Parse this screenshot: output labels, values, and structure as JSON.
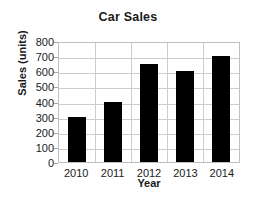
{
  "chart_data": {
    "type": "bar",
    "title": "Car Sales",
    "xlabel": "Year",
    "ylabel": "Sales (units)",
    "categories": [
      "2010",
      "2011",
      "2012",
      "2013",
      "2014"
    ],
    "values": [
      300,
      400,
      650,
      600,
      700
    ],
    "ylim": [
      0,
      800
    ],
    "ytick_labels": [
      "800",
      "700",
      "600",
      "500",
      "400",
      "300",
      "200",
      "100",
      "0"
    ],
    "ytick_values": [
      800,
      700,
      600,
      500,
      400,
      300,
      200,
      100,
      0
    ],
    "ytick_step": 100,
    "grid": true,
    "legend": null,
    "bar_color": "#000000",
    "grid_color": "#cccccc",
    "axis_color": "#bfbfbf",
    "background_color": "#ffffff",
    "text_color": "#1a1a1a"
  }
}
